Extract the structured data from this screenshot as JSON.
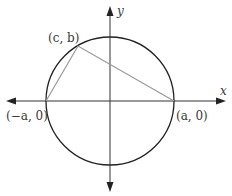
{
  "diagram": {
    "axes": {
      "x_label": "x",
      "y_label": "y"
    },
    "circle": {
      "center": [
        110,
        101
      ],
      "radius": 64
    },
    "points": [
      {
        "name": "top-vertex",
        "label": "(c, b)"
      },
      {
        "name": "left-vertex",
        "label": "(−a, 0)"
      },
      {
        "name": "right-vertex",
        "label": "(a, 0)"
      }
    ],
    "colors": {
      "axis": "#333333",
      "circle": "#222222",
      "triangle": "#9a9a9a"
    }
  }
}
